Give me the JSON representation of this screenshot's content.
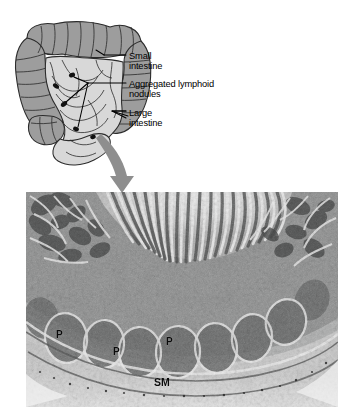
{
  "figure": {
    "background_color": "#ffffff",
    "width": 357,
    "height": 419
  },
  "diagram": {
    "name": "intestinal-tract-diagram",
    "colors": {
      "large_intestine_fill": "#9d9d9d",
      "small_intestine_fill": "#d8d8d8",
      "outline": "#2b2b2b",
      "nodule": "#111111",
      "arrow": "#8e8e8e"
    },
    "labels": [
      {
        "id": "small-intestine",
        "line1": "Small",
        "line2": "intestine",
        "text": "Small intestine"
      },
      {
        "id": "aggregated-lymphoid-nodules",
        "line1": "Aggregated lymphoid",
        "line2": "nodules",
        "text": "Aggregated lymphoid nodules"
      },
      {
        "id": "large-intestine",
        "line1": "Large",
        "line2": "intestine",
        "text": "Large intestine"
      }
    ]
  },
  "micrograph": {
    "name": "ileum-peyers-patch-micrograph",
    "description": "Low magnification light micrograph of the ileum wall showing villi and crypts at the top, a row of aggregated lymphoid nodules (Peyer's patches) in the mucosa, and the submucosa below",
    "frame": {
      "left": 26,
      "top": 192,
      "width": 312,
      "height": 215
    },
    "annotations": [
      {
        "id": "peyer-patch-1",
        "text": "P"
      },
      {
        "id": "peyer-patch-2",
        "text": "P"
      },
      {
        "id": "peyer-patch-3",
        "text": "P"
      },
      {
        "id": "submucosa",
        "text": "SM"
      }
    ]
  }
}
